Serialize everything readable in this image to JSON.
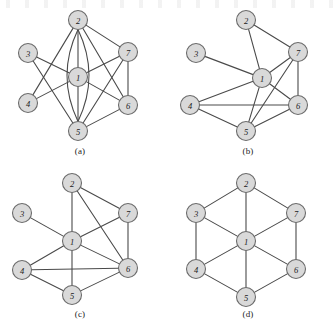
{
  "figure": {
    "background_color": "#ffffff",
    "node_fill_color": "#d9d9d9",
    "node_stroke_color": "#6b6b6b",
    "edge_color": "#4a4a4a",
    "panels": [
      {
        "id": "a",
        "caption": "(a)",
        "nodes": [
          {
            "label": "2",
            "x": 78,
            "y": 20
          },
          {
            "label": "3",
            "x": 28,
            "y": 53
          },
          {
            "label": "7",
            "x": 128,
            "y": 52
          },
          {
            "label": "1",
            "x": 78,
            "y": 77
          },
          {
            "label": "4",
            "x": 28,
            "y": 103
          },
          {
            "label": "6",
            "x": 128,
            "y": 105
          },
          {
            "label": "5",
            "x": 78,
            "y": 131
          }
        ],
        "edges": [
          {
            "from": "2",
            "to": "1",
            "type": "line"
          },
          {
            "from": "1",
            "to": "5",
            "type": "line"
          },
          {
            "from": "2",
            "to": "7",
            "type": "line"
          },
          {
            "from": "2",
            "to": "6",
            "type": "line"
          },
          {
            "from": "2",
            "to": "5",
            "type": "arc-left"
          },
          {
            "from": "2",
            "to": "5",
            "type": "arc-right"
          },
          {
            "from": "3",
            "to": "1",
            "type": "line"
          },
          {
            "from": "3",
            "to": "5",
            "type": "line"
          },
          {
            "from": "4",
            "to": "1",
            "type": "line"
          },
          {
            "from": "4",
            "to": "2",
            "type": "line"
          },
          {
            "from": "1",
            "to": "7",
            "type": "line"
          },
          {
            "from": "1",
            "to": "6",
            "type": "line"
          },
          {
            "from": "7",
            "to": "6",
            "type": "line"
          },
          {
            "from": "7",
            "to": "5",
            "type": "line"
          },
          {
            "from": "5",
            "to": "6",
            "type": "line"
          }
        ]
      },
      {
        "id": "b",
        "caption": "(b)",
        "nodes": [
          {
            "label": "2",
            "x": 78,
            "y": 20
          },
          {
            "label": "3",
            "x": 28,
            "y": 53
          },
          {
            "label": "7",
            "x": 130,
            "y": 52
          },
          {
            "label": "1",
            "x": 94,
            "y": 78
          },
          {
            "label": "4",
            "x": 22,
            "y": 105
          },
          {
            "label": "6",
            "x": 130,
            "y": 105
          },
          {
            "label": "5",
            "x": 78,
            "y": 131
          }
        ],
        "edges": [
          {
            "from": "2",
            "to": "1",
            "type": "line"
          },
          {
            "from": "2",
            "to": "7",
            "type": "line"
          },
          {
            "from": "3",
            "to": "1",
            "type": "line"
          },
          {
            "from": "1",
            "to": "7",
            "type": "line"
          },
          {
            "from": "1",
            "to": "6",
            "type": "line"
          },
          {
            "from": "1",
            "to": "4",
            "type": "line"
          },
          {
            "from": "1",
            "to": "5",
            "type": "line"
          },
          {
            "from": "7",
            "to": "6",
            "type": "line"
          },
          {
            "from": "7",
            "to": "5",
            "type": "line"
          },
          {
            "from": "4",
            "to": "6",
            "type": "line"
          },
          {
            "from": "4",
            "to": "5",
            "type": "line"
          },
          {
            "from": "5",
            "to": "6",
            "type": "line"
          }
        ]
      },
      {
        "id": "c",
        "caption": "(c)",
        "nodes": [
          {
            "label": "2",
            "x": 72,
            "y": 20
          },
          {
            "label": "3",
            "x": 22,
            "y": 50
          },
          {
            "label": "7",
            "x": 128,
            "y": 50
          },
          {
            "label": "1",
            "x": 72,
            "y": 78
          },
          {
            "label": "4",
            "x": 22,
            "y": 107
          },
          {
            "label": "6",
            "x": 128,
            "y": 105
          },
          {
            "label": "5",
            "x": 72,
            "y": 132
          }
        ],
        "edges": [
          {
            "from": "2",
            "to": "1",
            "type": "line"
          },
          {
            "from": "2",
            "to": "7",
            "type": "line"
          },
          {
            "from": "2",
            "to": "6",
            "type": "line"
          },
          {
            "from": "3",
            "to": "1",
            "type": "line"
          },
          {
            "from": "1",
            "to": "7",
            "type": "line"
          },
          {
            "from": "1",
            "to": "6",
            "type": "line"
          },
          {
            "from": "1",
            "to": "4",
            "type": "line"
          },
          {
            "from": "1",
            "to": "5",
            "type": "line"
          },
          {
            "from": "7",
            "to": "6",
            "type": "line"
          },
          {
            "from": "4",
            "to": "6",
            "type": "line"
          },
          {
            "from": "4",
            "to": "5",
            "type": "line"
          },
          {
            "from": "5",
            "to": "6",
            "type": "line"
          }
        ]
      },
      {
        "id": "d",
        "caption": "(d)",
        "nodes": [
          {
            "label": "2",
            "x": 78,
            "y": 20
          },
          {
            "label": "3",
            "x": 28,
            "y": 50
          },
          {
            "label": "7",
            "x": 128,
            "y": 50
          },
          {
            "label": "1",
            "x": 78,
            "y": 78
          },
          {
            "label": "4",
            "x": 28,
            "y": 106
          },
          {
            "label": "6",
            "x": 128,
            "y": 106
          },
          {
            "label": "5",
            "x": 78,
            "y": 134
          }
        ],
        "edges": [
          {
            "from": "2",
            "to": "3",
            "type": "line"
          },
          {
            "from": "2",
            "to": "7",
            "type": "line"
          },
          {
            "from": "3",
            "to": "4",
            "type": "line"
          },
          {
            "from": "7",
            "to": "6",
            "type": "line"
          },
          {
            "from": "4",
            "to": "5",
            "type": "line"
          },
          {
            "from": "5",
            "to": "6",
            "type": "line"
          },
          {
            "from": "1",
            "to": "2",
            "type": "line"
          },
          {
            "from": "1",
            "to": "3",
            "type": "line"
          },
          {
            "from": "1",
            "to": "7",
            "type": "line"
          },
          {
            "from": "1",
            "to": "4",
            "type": "line"
          },
          {
            "from": "1",
            "to": "6",
            "type": "line"
          },
          {
            "from": "1",
            "to": "5",
            "type": "line"
          }
        ]
      }
    ]
  }
}
